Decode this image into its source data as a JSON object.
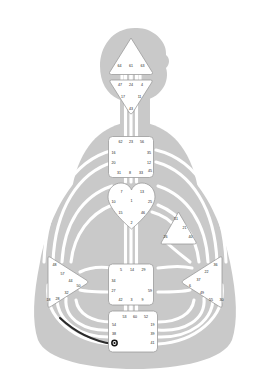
{
  "figure": {
    "body_color": "#c9c9c9",
    "channel_color": "#ffffff",
    "center_fill": "#ffffff",
    "center_stroke": "#9a9a9a",
    "gate_text_color": "#1a1a1a",
    "activated_channel_color": "#2b2b2b",
    "background": "#ffffff"
  },
  "centers": [
    {
      "id": "head",
      "name": "Head Center",
      "shape": "triangle-up",
      "defined": false,
      "gates": [
        {
          "number": "64",
          "x": 119.5,
          "y": 66.5
        },
        {
          "number": "61",
          "x": 131.0,
          "y": 66.5
        },
        {
          "number": "63",
          "x": 142.5,
          "y": 66.5
        }
      ]
    },
    {
      "id": "ajna",
      "name": "Ajna Center",
      "shape": "triangle-down",
      "defined": false,
      "gates": [
        {
          "number": "47",
          "x": 120.0,
          "y": 85.0
        },
        {
          "number": "24",
          "x": 131.0,
          "y": 85.0
        },
        {
          "number": "4",
          "x": 142.0,
          "y": 85.0
        },
        {
          "number": "17",
          "x": 123.0,
          "y": 97.5
        },
        {
          "number": "11",
          "x": 139.5,
          "y": 97.5
        },
        {
          "number": "43",
          "x": 131.0,
          "y": 109.0
        }
      ]
    },
    {
      "id": "throat",
      "name": "Throat Center",
      "shape": "square",
      "defined": false,
      "gates": [
        {
          "number": "62",
          "x": 120.5,
          "y": 142.5
        },
        {
          "number": "23",
          "x": 131.0,
          "y": 142.5
        },
        {
          "number": "56",
          "x": 142.0,
          "y": 142.5
        },
        {
          "number": "16",
          "x": 113.5,
          "y": 153.5
        },
        {
          "number": "35",
          "x": 149.0,
          "y": 153.5
        },
        {
          "number": "20",
          "x": 113.5,
          "y": 163.5
        },
        {
          "number": "12",
          "x": 149.0,
          "y": 163.5
        },
        {
          "number": "45",
          "x": 150.0,
          "y": 171.0
        },
        {
          "number": "31",
          "x": 119.0,
          "y": 173.5
        },
        {
          "number": "8",
          "x": 130.0,
          "y": 173.5
        },
        {
          "number": "33",
          "x": 141.0,
          "y": 173.5
        }
      ]
    },
    {
      "id": "g",
      "name": "G Center (Identity)",
      "shape": "heart",
      "defined": false,
      "gates": [
        {
          "number": "7",
          "x": 121.5,
          "y": 192.5
        },
        {
          "number": "13",
          "x": 142.0,
          "y": 192.0
        },
        {
          "number": "10",
          "x": 113.5,
          "y": 202.0
        },
        {
          "number": "1",
          "x": 131.5,
          "y": 201.5
        },
        {
          "number": "25",
          "x": 150.0,
          "y": 202.5
        },
        {
          "number": "15",
          "x": 120.5,
          "y": 213.0
        },
        {
          "number": "46",
          "x": 143.0,
          "y": 213.0
        },
        {
          "number": "2",
          "x": 131.5,
          "y": 223.5
        }
      ]
    },
    {
      "id": "ego",
      "name": "Ego / Heart Center",
      "shape": "triangle-left",
      "defined": false,
      "gates": [
        {
          "number": "51",
          "x": 176.0,
          "y": 219.5
        },
        {
          "number": "21",
          "x": 184.5,
          "y": 228.0
        },
        {
          "number": "26",
          "x": 165.5,
          "y": 237.5
        },
        {
          "number": "40",
          "x": 190.5,
          "y": 237.5
        }
      ]
    },
    {
      "id": "spleen",
      "name": "Spleen Center",
      "shape": "triangle-right",
      "defined": false,
      "gates": [
        {
          "number": "48",
          "x": 54.5,
          "y": 265.0
        },
        {
          "number": "57",
          "x": 62.5,
          "y": 274.0
        },
        {
          "number": "44",
          "x": 70.5,
          "y": 281.0
        },
        {
          "number": "50",
          "x": 78.5,
          "y": 286.5
        },
        {
          "number": "32",
          "x": 66.5,
          "y": 293.5
        },
        {
          "number": "28",
          "x": 57.5,
          "y": 299.5
        },
        {
          "number": "18",
          "x": 48.5,
          "y": 300.5
        }
      ]
    },
    {
      "id": "sacral",
      "name": "Sacral Center",
      "shape": "square",
      "defined": false,
      "gates": [
        {
          "number": "5",
          "x": 121.0,
          "y": 270.5
        },
        {
          "number": "14",
          "x": 132.0,
          "y": 270.5
        },
        {
          "number": "29",
          "x": 143.5,
          "y": 270.5
        },
        {
          "number": "34",
          "x": 113.5,
          "y": 281.5
        },
        {
          "number": "27",
          "x": 113.5,
          "y": 291.5
        },
        {
          "number": "59",
          "x": 150.0,
          "y": 291.5
        },
        {
          "number": "42",
          "x": 120.5,
          "y": 300.0
        },
        {
          "number": "3",
          "x": 131.5,
          "y": 300.0
        },
        {
          "number": "9",
          "x": 142.5,
          "y": 300.0
        }
      ]
    },
    {
      "id": "solar-plexus",
      "name": "Solar Plexus Center",
      "shape": "triangle-left",
      "defined": false,
      "gates": [
        {
          "number": "36",
          "x": 215.5,
          "y": 265.0
        },
        {
          "number": "22",
          "x": 206.5,
          "y": 272.5
        },
        {
          "number": "37",
          "x": 198.5,
          "y": 280.5
        },
        {
          "number": "6",
          "x": 190.0,
          "y": 286.0
        },
        {
          "number": "49",
          "x": 202.0,
          "y": 293.5
        },
        {
          "number": "55",
          "x": 211.0,
          "y": 300.5
        },
        {
          "number": "30",
          "x": 221.5,
          "y": 300.5
        }
      ]
    },
    {
      "id": "root",
      "name": "Root Center",
      "shape": "square",
      "defined": false,
      "gates": [
        {
          "number": "53",
          "x": 124.5,
          "y": 317.5
        },
        {
          "number": "60",
          "x": 135.0,
          "y": 317.5
        },
        {
          "number": "52",
          "x": 146.0,
          "y": 317.5
        },
        {
          "number": "54",
          "x": 114.0,
          "y": 325.5
        },
        {
          "number": "19",
          "x": 152.5,
          "y": 325.5
        },
        {
          "number": "38",
          "x": 114.0,
          "y": 334.5
        },
        {
          "number": "39",
          "x": 152.5,
          "y": 334.5
        },
        {
          "number": "41",
          "x": 152.5,
          "y": 343.5
        }
      ]
    }
  ],
  "markers": [
    {
      "id": "activation-dot",
      "name": "gate-38-activation-dot",
      "x": 114.5,
      "y": 343.0,
      "r": 3.2
    }
  ]
}
